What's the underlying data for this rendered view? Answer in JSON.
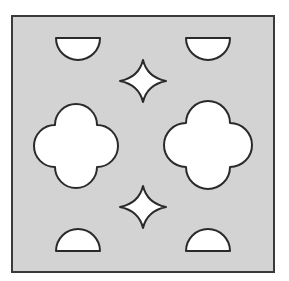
{
  "figure": {
    "colors": {
      "background": "#ffffff",
      "tile_fill": "#d3d3d3",
      "tile_stroke": "#3a3a3a",
      "shape_fill": "#ffffff",
      "shape_stroke": "#2a2a2a"
    },
    "tile": {
      "x": 12,
      "y": 16,
      "width": 262,
      "height": 256
    },
    "half_discs": [
      {
        "id": "top-left",
        "cx": 78,
        "cy": 38,
        "r": 22,
        "orientation": "down"
      },
      {
        "id": "top-right",
        "cx": 208,
        "cy": 38,
        "r": 22,
        "orientation": "down"
      },
      {
        "id": "bottom-left",
        "cx": 78,
        "cy": 251,
        "r": 22,
        "orientation": "up"
      },
      {
        "id": "bottom-right",
        "cx": 208,
        "cy": 251,
        "r": 22,
        "orientation": "up"
      }
    ],
    "stars": [
      {
        "id": "top",
        "cx": 143,
        "cy": 81,
        "rx": 23,
        "ry": 21
      },
      {
        "id": "bottom",
        "cx": 143,
        "cy": 207,
        "rx": 23,
        "ry": 21
      }
    ],
    "quatrefoils": [
      {
        "id": "left",
        "cx": 76,
        "cy": 146,
        "lobe_offset": 21,
        "lobe_r": 21
      },
      {
        "id": "right",
        "cx": 208,
        "cy": 145,
        "lobe_offset": 22,
        "lobe_r": 22
      }
    ]
  }
}
